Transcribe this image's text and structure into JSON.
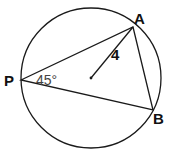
{
  "diagram": {
    "type": "circle-inscribed-triangle",
    "points": {
      "P": {
        "label": "P",
        "x": 21,
        "y": 80
      },
      "A": {
        "label": "A",
        "x": 133,
        "y": 27
      },
      "B": {
        "label": "B",
        "x": 153,
        "y": 110
      },
      "center": {
        "x": 91,
        "y": 78
      }
    },
    "circle": {
      "cx": 91,
      "cy": 78,
      "r": 70
    },
    "angle_label": "45°",
    "radius_label": "4",
    "colors": {
      "stroke": "#1a1a1a",
      "background": "#ffffff"
    }
  }
}
